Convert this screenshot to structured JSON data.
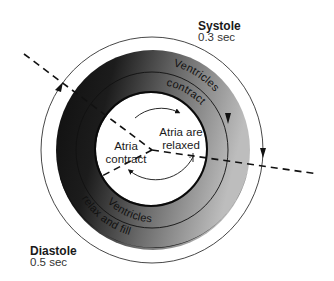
{
  "systole": {
    "title": "Systole",
    "duration": "0.3 sec"
  },
  "diastole": {
    "title": "Diastole",
    "duration": "0.5 sec"
  },
  "ring": {
    "outer_top_text": "Ventricles",
    "inner_top_text": "contract",
    "outer_bottom_text": "Ventricles",
    "inner_bottom_text": "relax and fill",
    "dark_color": "#141414",
    "light_color": "#b4b4b4"
  },
  "center": {
    "left_line1": "Atria",
    "left_line2": "contract",
    "right_line1": "Atria are",
    "right_line2": "relaxed"
  }
}
